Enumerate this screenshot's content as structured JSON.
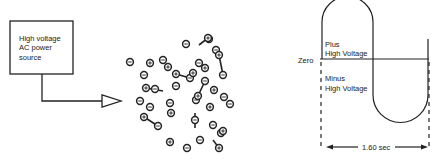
{
  "left_diagram": {
    "power_source": {
      "line1": "High voltage",
      "line2": "AC power",
      "line3": "source"
    },
    "particles": {
      "negative": [
        [
          130,
          62
        ],
        [
          144,
          75
        ],
        [
          155,
          89
        ],
        [
          163,
          60
        ],
        [
          176,
          86
        ],
        [
          190,
          78
        ],
        [
          199,
          63
        ],
        [
          209,
          39
        ],
        [
          216,
          50
        ],
        [
          223,
          75
        ],
        [
          230,
          104
        ],
        [
          213,
          125
        ],
        [
          195,
          120
        ],
        [
          200,
          140
        ],
        [
          187,
          148
        ],
        [
          221,
          133
        ],
        [
          150,
          107
        ],
        [
          158,
          126
        ],
        [
          170,
          103
        ],
        [
          205,
          81
        ],
        [
          196,
          100
        ],
        [
          224,
          97
        ],
        [
          186,
          44
        ],
        [
          140,
          101
        ]
      ],
      "positive": [
        [
          146,
          88
        ],
        [
          144,
          117
        ],
        [
          171,
          113
        ],
        [
          170,
          142
        ],
        [
          176,
          74
        ],
        [
          193,
          73
        ],
        [
          219,
          55
        ],
        [
          208,
          38
        ],
        [
          198,
          96
        ],
        [
          210,
          107
        ],
        [
          223,
          131
        ],
        [
          219,
          148
        ],
        [
          168,
          67
        ],
        [
          150,
          63
        ],
        [
          205,
          68
        ],
        [
          214,
          90
        ]
      ],
      "negative_symbol": "⊖",
      "positive_symbol": "⊕"
    }
  },
  "right_diagram": {
    "zero_label": "Zero",
    "plus_label_1": "Plus",
    "plus_label_2": "High Voltage",
    "minus_label_1": "Minus",
    "minus_label_2": "High Voltage",
    "period_label": "1.60 sec"
  }
}
